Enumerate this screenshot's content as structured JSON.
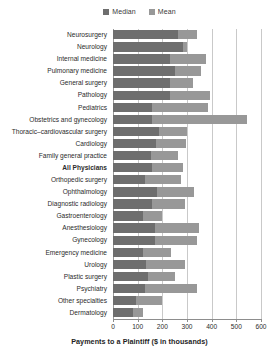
{
  "chart_data": {
    "type": "bar",
    "orientation": "horizontal",
    "title": "",
    "xlabel": "Payments to a Plaintiff ($ in thousands)",
    "ylabel": "",
    "xlim": [
      0,
      600
    ],
    "xticks": [
      0,
      100,
      200,
      300,
      400,
      500,
      600
    ],
    "grid": true,
    "legend_position": "top-center",
    "legend": [
      "Median",
      "Mean"
    ],
    "highlight_category": "All Physicians",
    "categories": [
      "Neurosurgery",
      "Neurology",
      "Internal medicine",
      "Pulmonary medicine",
      "General surgery",
      "Pathology",
      "Pediatrics",
      "Obstetrics and gynecology",
      "Thoracic–cardiovascular surgery",
      "Cardiology",
      "Family general practice",
      "All Physicians",
      "Orthopedic surgery",
      "Ophthalmology",
      "Diagnostic radiology",
      "Gastroenterology",
      "Anesthesiology",
      "Gynecology",
      "Emergency medicine",
      "Urology",
      "Plastic surgery",
      "Psychiatry",
      "Other specialties",
      "Dermatology"
    ],
    "series": [
      {
        "name": "Median",
        "color": "#6e6e6e",
        "values": [
          265,
          285,
          230,
          250,
          230,
          230,
          160,
          160,
          185,
          175,
          155,
          160,
          130,
          180,
          160,
          120,
          170,
          170,
          120,
          135,
          140,
          130,
          95,
          80
        ]
      },
      {
        "name": "Mean",
        "color": "#989898",
        "values": [
          340,
          300,
          375,
          355,
          325,
          395,
          385,
          545,
          300,
          295,
          265,
          285,
          275,
          330,
          290,
          200,
          350,
          340,
          235,
          290,
          250,
          340,
          200,
          120
        ]
      }
    ]
  },
  "legend": {
    "entries": [
      {
        "label": "Median",
        "color": "#6e6e6e",
        "swatch_name": "median-swatch"
      },
      {
        "label": "Mean",
        "color": "#989898",
        "swatch_name": "mean-swatch"
      }
    ]
  },
  "axis": {
    "x_title": "Payments to a Plaintiff ($ in thousands)",
    "x_tick_labels": [
      "0",
      "100",
      "200",
      "300",
      "400",
      "500",
      "600"
    ]
  },
  "colors": {
    "median": "#6e6e6e",
    "mean": "#989898",
    "gridline": "#c9c9c9",
    "axis": "#8d8d8d",
    "background": "#ffffff",
    "text": "#2b2b2b"
  }
}
